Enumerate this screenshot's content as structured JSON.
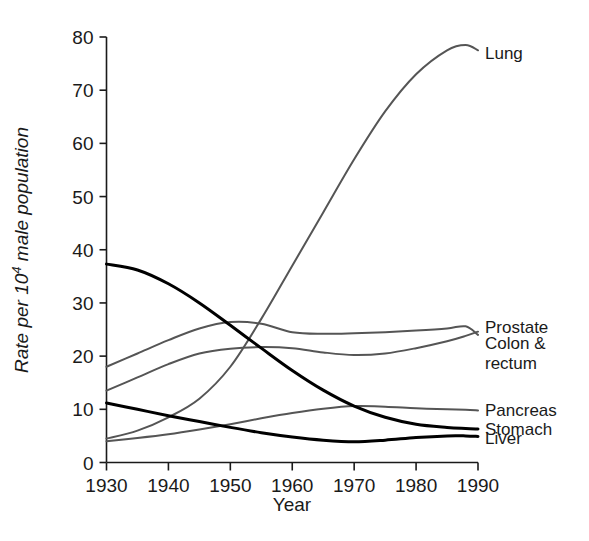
{
  "chart_data": {
    "type": "line",
    "title": "",
    "xlabel": "Year",
    "ylabel": "Rate per 10⁴ male population",
    "ylabel_main": "Rate per 10",
    "ylabel_exp": "4",
    "ylabel_tail": " male population",
    "xlim": [
      1930,
      1990
    ],
    "ylim": [
      0,
      80
    ],
    "xticks": [
      1930,
      1940,
      1950,
      1960,
      1970,
      1980,
      1990
    ],
    "yticks": [
      0,
      10,
      20,
      30,
      40,
      50,
      60,
      70,
      80
    ],
    "grid": false,
    "legend_position": "right-inline-labels",
    "x": [
      1930,
      1935,
      1940,
      1945,
      1950,
      1955,
      1960,
      1965,
      1970,
      1975,
      1980,
      1985,
      1988,
      1990
    ],
    "series": [
      {
        "name": "Lung",
        "color": "#555555",
        "width": 2.0,
        "label": "Lung",
        "label_x": 1991,
        "label_y": 77,
        "values": [
          4.5,
          6.0,
          8.5,
          12.0,
          18.0,
          27.0,
          37.0,
          47.0,
          57.0,
          66.0,
          73.0,
          77.5,
          78.5,
          77.5
        ]
      },
      {
        "name": "Prostate",
        "color": "#555555",
        "width": 2.0,
        "label": "Prostate",
        "label_x": 1991,
        "label_y": 25.5,
        "values": [
          18.0,
          20.5,
          23.0,
          25.2,
          26.4,
          26.1,
          24.5,
          24.2,
          24.3,
          24.5,
          24.8,
          25.2,
          25.6,
          24.0
        ]
      },
      {
        "name": "Colon & rectum",
        "color": "#555555",
        "width": 2.0,
        "label": "Colon &\nrectum",
        "label_line1": "Colon &",
        "label_line2": "rectum",
        "label_x": 1991,
        "label_y": 21.5,
        "values": [
          13.5,
          16.0,
          18.5,
          20.5,
          21.4,
          21.7,
          21.5,
          20.7,
          20.2,
          20.5,
          21.5,
          22.8,
          23.8,
          24.6
        ]
      },
      {
        "name": "Pancreas",
        "color": "#555555",
        "width": 2.0,
        "label": "Pancreas",
        "label_x": 1991,
        "label_y": 9.8,
        "values": [
          4.0,
          4.6,
          5.3,
          6.2,
          7.2,
          8.3,
          9.3,
          10.1,
          10.6,
          10.5,
          10.2,
          10.0,
          9.9,
          9.8
        ]
      },
      {
        "name": "Stomach",
        "color": "#000000",
        "width": 3.0,
        "label": "Stomach",
        "label_x": 1991,
        "label_y": 6.3,
        "values": [
          37.3,
          36.2,
          33.6,
          30.0,
          25.8,
          21.5,
          17.3,
          13.6,
          10.6,
          8.5,
          7.2,
          6.6,
          6.4,
          6.3
        ]
      },
      {
        "name": "Liver",
        "color": "#000000",
        "width": 3.0,
        "label": "Liver",
        "label_x": 1991,
        "label_y": 4.6,
        "values": [
          11.2,
          10.0,
          8.8,
          7.7,
          6.6,
          5.6,
          4.8,
          4.2,
          3.9,
          4.2,
          4.7,
          5.0,
          5.0,
          4.9
        ]
      }
    ]
  },
  "axes": {
    "y_label_main": "Rate per 10",
    "y_label_exp": "4",
    "y_label_tail": "male population",
    "x_label": "Year"
  },
  "ticks": {
    "y": [
      "0",
      "10",
      "20",
      "30",
      "40",
      "50",
      "60",
      "70",
      "80"
    ],
    "x": [
      "1930",
      "1940",
      "1950",
      "1960",
      "1970",
      "1980",
      "1990"
    ]
  },
  "labels": {
    "lung": "Lung",
    "prostate": "Prostate",
    "colon_line1": "Colon &",
    "colon_line2": "rectum",
    "pancreas": "Pancreas",
    "stomach": "Stomach",
    "liver": "Liver"
  },
  "colors": {
    "gray_line": "#555555",
    "black_line": "#000000",
    "axis": "#1a1a1a",
    "background": "#ffffff"
  }
}
